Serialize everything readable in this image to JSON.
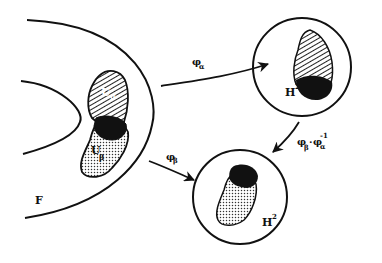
{
  "diagram": {
    "type": "chart-transition-map",
    "manifold_label": "F",
    "regions": [
      {
        "id": "U_alpha",
        "label_main": "U",
        "label_sub": "α",
        "pattern": "hatched"
      },
      {
        "id": "U_beta",
        "label_main": "U",
        "label_sub": "β",
        "pattern": "dotted"
      },
      {
        "id": "overlap",
        "pattern": "solid-black"
      }
    ],
    "targets": [
      {
        "id": "disk-top",
        "label_main": "H",
        "label_sup": "2"
      },
      {
        "id": "disk-bottom",
        "label_main": "H",
        "label_sup": "2"
      }
    ],
    "maps": [
      {
        "id": "phi-alpha",
        "label_main": "φ",
        "label_sub": "α",
        "from": "U_alpha",
        "to": "disk-top"
      },
      {
        "id": "phi-beta",
        "label_main": "φ",
        "label_sub": "β",
        "from": "U_beta",
        "to": "disk-bottom"
      },
      {
        "id": "transition",
        "label_main": "φ",
        "label_sub1": "β",
        "dot": "·",
        "label_main2": "φ",
        "label_sub2": "α",
        "label_sup2": "-1",
        "from": "disk-top",
        "to": "disk-bottom"
      }
    ],
    "colors": {
      "ink": "#111111",
      "background": "#ffffff"
    }
  }
}
